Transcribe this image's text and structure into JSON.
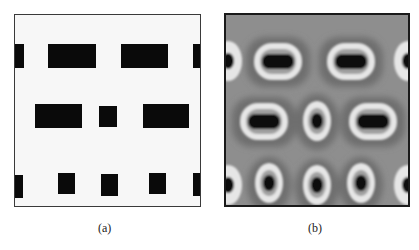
{
  "figure": {
    "panels": [
      {
        "id": "a",
        "caption": "(a)",
        "description": "binary mask pattern",
        "colors": {
          "background": "#f7f7f7",
          "feature": "#0a0a0a",
          "border": "#3a3a3a"
        },
        "rows": [
          {
            "features": [
              {
                "x": 0,
                "w": 9
              },
              {
                "x": 33,
                "w": 48
              },
              {
                "x": 106,
                "w": 47
              },
              {
                "x": 178,
                "w": 9
              }
            ],
            "y": 29,
            "h": 24
          },
          {
            "features": [
              {
                "x": 20,
                "w": 47
              },
              {
                "x": 84,
                "w": 18
              },
              {
                "x": 128,
                "w": 46
              }
            ],
            "y": 89,
            "h": 24
          },
          {
            "features": [
              {
                "x": 0,
                "w": 8
              },
              {
                "x": 43,
                "w": 17
              },
              {
                "x": 86,
                "w": 17
              },
              {
                "x": 134,
                "w": 17
              },
              {
                "x": 178,
                "w": 9
              }
            ],
            "y": 158,
            "h": 24
          }
        ]
      },
      {
        "id": "b",
        "caption": "(b)",
        "description": "simulated intensity image",
        "colors": {
          "background": "#8c8c8c",
          "halo": "#e8e8e8",
          "core": "#0a0a0a",
          "border": "#1a1a1a"
        }
      }
    ]
  }
}
